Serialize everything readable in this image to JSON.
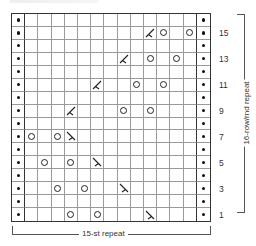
{
  "chart": {
    "columns": 15,
    "rows": 16,
    "row_labels": [
      "15",
      "13",
      "11",
      "9",
      "7",
      "5",
      "3",
      "1"
    ],
    "stitch_repeat_label": "15-st repeat",
    "row_repeat_label": "16-row/rnd repeat",
    "edge_symbol": "purl-dot",
    "symbols": [
      {
        "row": 15,
        "col": 10,
        "type": "dec-left"
      },
      {
        "row": 15,
        "col": 11,
        "type": "yo"
      },
      {
        "row": 15,
        "col": 13,
        "type": "yo"
      },
      {
        "row": 13,
        "col": 8,
        "type": "dec-left"
      },
      {
        "row": 13,
        "col": 10,
        "type": "yo"
      },
      {
        "row": 13,
        "col": 12,
        "type": "yo"
      },
      {
        "row": 11,
        "col": 6,
        "type": "dec-left"
      },
      {
        "row": 11,
        "col": 9,
        "type": "yo"
      },
      {
        "row": 11,
        "col": 11,
        "type": "yo"
      },
      {
        "row": 9,
        "col": 4,
        "type": "dec-left"
      },
      {
        "row": 9,
        "col": 8,
        "type": "yo"
      },
      {
        "row": 9,
        "col": 10,
        "type": "yo"
      },
      {
        "row": 7,
        "col": 1,
        "type": "yo"
      },
      {
        "row": 7,
        "col": 3,
        "type": "yo"
      },
      {
        "row": 7,
        "col": 4,
        "type": "dec-right"
      },
      {
        "row": 5,
        "col": 2,
        "type": "yo"
      },
      {
        "row": 5,
        "col": 4,
        "type": "yo"
      },
      {
        "row": 5,
        "col": 6,
        "type": "dec-right"
      },
      {
        "row": 3,
        "col": 3,
        "type": "yo"
      },
      {
        "row": 3,
        "col": 5,
        "type": "yo"
      },
      {
        "row": 3,
        "col": 8,
        "type": "dec-right"
      },
      {
        "row": 1,
        "col": 4,
        "type": "yo"
      },
      {
        "row": 1,
        "col": 6,
        "type": "yo"
      },
      {
        "row": 1,
        "col": 10,
        "type": "dec-right"
      }
    ]
  }
}
